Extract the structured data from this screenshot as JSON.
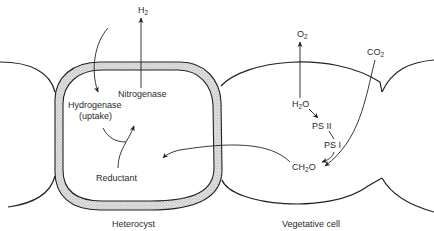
{
  "diagram": {
    "type": "biological-schematic",
    "colors": {
      "line": "#222222",
      "wall_fill": "#d4d4d4",
      "background": "#ffffff"
    },
    "labels": {
      "h2": {
        "main": "H",
        "sub": "2"
      },
      "o2": {
        "main": "O",
        "sub": "2"
      },
      "co2": {
        "main": "CO",
        "sub": "2"
      },
      "nitrogenase": "Nitrogenase",
      "hydrogenase": "Hydrogenase",
      "uptake": "(uptake)",
      "reductant": "Reductant",
      "h2o": {
        "pre": "H",
        "sub": "2",
        "post": "O"
      },
      "ps2": "PS II",
      "ps1": "PS I",
      "ch2o": {
        "pre": "CH",
        "sub": "2",
        "post": "O"
      },
      "heterocyst": "Heterocyst",
      "vegetative_cell": "Vegetative cell"
    }
  }
}
